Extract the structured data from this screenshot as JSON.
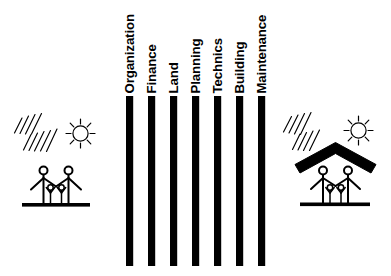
{
  "diagram": {
    "type": "conceptual-pillar-diagram",
    "background_color": "#ffffff",
    "ink_color": "#000000"
  },
  "pillars": {
    "count": 7,
    "orientation": "vertical",
    "label_rotation_degrees": -90,
    "items": [
      {
        "label": "Organization",
        "index": 1
      },
      {
        "label": "Finance",
        "index": 2
      },
      {
        "label": "Land",
        "index": 3
      },
      {
        "label": "Planning",
        "index": 4
      },
      {
        "label": "Technics",
        "index": 5
      },
      {
        "label": "Building",
        "index": 6
      },
      {
        "label": "Maintenance",
        "index": 7
      }
    ]
  },
  "left_scene": {
    "name": "family-without-shelter",
    "has_roof": false,
    "elements": {
      "sun": "sun-icon",
      "rain": "rain-icon",
      "adults": 2,
      "children": 2,
      "ground": "ground-line"
    }
  },
  "right_scene": {
    "name": "family-with-shelter",
    "has_roof": true,
    "elements": {
      "sun": "sun-icon",
      "rain": "rain-icon",
      "roof": "roof-icon",
      "adults": 2,
      "children": 2,
      "ground": "ground-line"
    }
  }
}
